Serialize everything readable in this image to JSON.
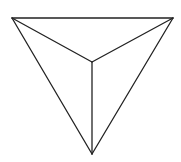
{
  "diagram": {
    "stroke_color": "#222222",
    "background": "#ffffff",
    "vertices": {
      "top_left": [
        12,
        18
      ],
      "top_right": [
        173,
        18
      ],
      "bottom": [
        92,
        154
      ],
      "apex": [
        92,
        62
      ]
    },
    "edges": [
      [
        "top_left",
        "top_right"
      ],
      [
        "top_right",
        "bottom"
      ],
      [
        "bottom",
        "top_left"
      ],
      [
        "top_left",
        "apex"
      ],
      [
        "top_right",
        "apex"
      ],
      [
        "bottom",
        "apex"
      ]
    ]
  }
}
